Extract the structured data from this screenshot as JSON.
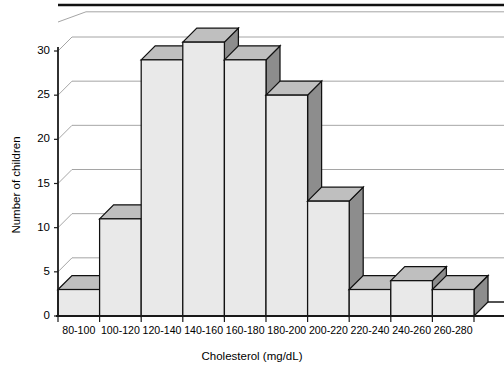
{
  "chart_data": {
    "type": "bar",
    "title": "",
    "xlabel": "Cholesterol (mg/dL)",
    "ylabel": "Number of children",
    "categories": [
      "80-100",
      "100-120",
      "120-140",
      "140-160",
      "160-180",
      "180-200",
      "200-220",
      "220-240",
      "240-260",
      "260-280"
    ],
    "values": [
      3,
      11,
      29,
      31,
      29,
      25,
      13,
      3,
      4,
      3
    ],
    "ylim": [
      0,
      30
    ],
    "yticks": [
      0,
      5,
      10,
      15,
      20,
      25,
      30
    ],
    "ytick_labels": [
      "0",
      "5",
      "10",
      "15",
      "20",
      "25",
      "30"
    ],
    "grid": true,
    "grid_axis": "y",
    "legend": false,
    "legend_position": "none",
    "style": "3d-bars",
    "colors": {
      "bar_front": "#e9e9e9",
      "bar_top": "#bfbfbf",
      "bar_side": "#8d8d8d",
      "outline": "#111111",
      "gridline": "#8e8e8e",
      "axis": "#1a1a1a",
      "background": "#ffffff"
    }
  },
  "figure": {
    "top_rule": "horizontal-rule",
    "axis_label_x": "Cholesterol (mg/dL)",
    "axis_label_y": "Number of children"
  }
}
